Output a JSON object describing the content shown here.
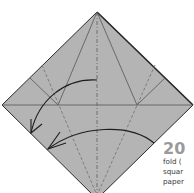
{
  "diagram": {
    "type": "origami-fold-step",
    "paper_color": "#b4b4b4",
    "edge_color": "#2a2a2a",
    "crease_color": "#555555",
    "arrow_color": "#1e1e1e"
  },
  "caption": {
    "step_number": "20",
    "lines": [
      "fold (",
      "squar",
      "paper"
    ]
  }
}
